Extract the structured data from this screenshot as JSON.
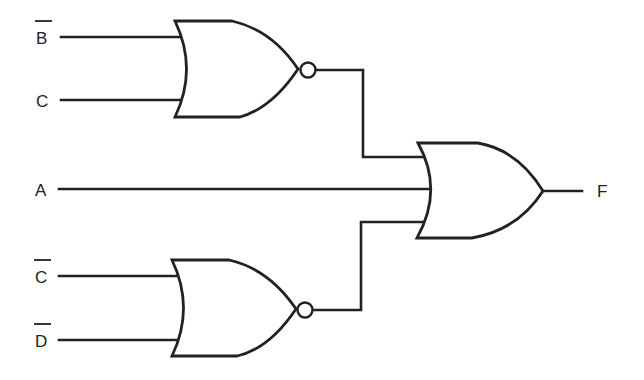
{
  "diagram": {
    "type": "logic-circuit",
    "colors": {
      "line": "#222222",
      "background": "#ffffff"
    },
    "inputs": [
      {
        "id": "B_bar",
        "label": "B",
        "complemented": true,
        "feeds": "nor_top"
      },
      {
        "id": "C",
        "label": "C",
        "complemented": false,
        "feeds": "nor_top"
      },
      {
        "id": "A",
        "label": "A",
        "complemented": false,
        "feeds": "or_out"
      },
      {
        "id": "C_bar",
        "label": "C",
        "complemented": true,
        "feeds": "nor_bottom"
      },
      {
        "id": "D_bar",
        "label": "D",
        "complemented": true,
        "feeds": "nor_bottom"
      }
    ],
    "gates": [
      {
        "id": "nor_top",
        "type": "NOR",
        "inputs": [
          "B_bar",
          "C"
        ]
      },
      {
        "id": "nor_bottom",
        "type": "NOR",
        "inputs": [
          "C_bar",
          "D_bar"
        ]
      },
      {
        "id": "or_out",
        "type": "OR",
        "inputs": [
          "nor_top",
          "A",
          "nor_bottom"
        ]
      }
    ],
    "output": {
      "id": "F",
      "label": "F",
      "from": "or_out"
    }
  }
}
